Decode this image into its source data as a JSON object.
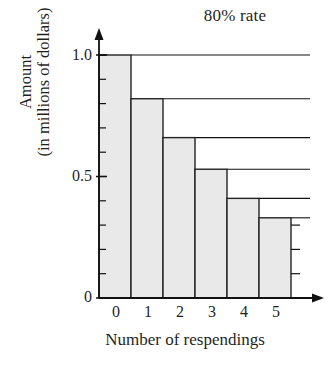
{
  "chart_data": {
    "type": "bar",
    "title": "80% rate",
    "xlabel": "Number of respendings",
    "ylabel_lines": [
      "Amount",
      "(in millions of dollars)"
    ],
    "categories": [
      "0",
      "1",
      "2",
      "3",
      "4",
      "5"
    ],
    "values": [
      1.0,
      0.82,
      0.66,
      0.53,
      0.41,
      0.33
    ],
    "ylim": [
      0,
      1.0
    ],
    "xlim": [
      0,
      6
    ],
    "y_major_ticks": [
      0,
      0.5,
      1.0
    ],
    "y_major_tick_labels": [
      "0",
      "0.5",
      "1.0"
    ],
    "y_minor_tick_step": 0.1,
    "grid": "horizontal-from-bar-tops",
    "legend": null,
    "bar_fill_color": "#e9e9e9",
    "bar_edge_color": "#222222",
    "axis_color": "#111111",
    "background_color": "#ffffff"
  }
}
